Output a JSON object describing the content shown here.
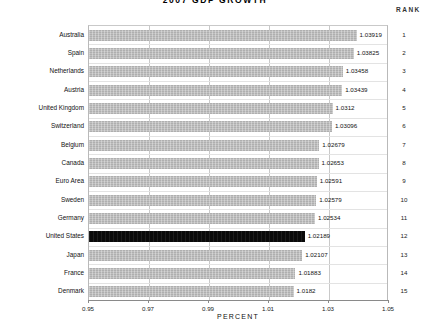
{
  "chart_data": {
    "type": "bar",
    "orientation": "horizontal",
    "title": "2007  GDP  GROWTH",
    "xlabel": "PERCENT",
    "ylabel": "",
    "xlim": [
      0.95,
      1.05
    ],
    "xticks": [
      "0.95",
      "0.97",
      "0.99",
      "1.01",
      "1.03",
      "1.05"
    ],
    "xtick_values": [
      0.95,
      0.97,
      0.99,
      1.01,
      1.03,
      1.05
    ],
    "grid": true,
    "legend": null,
    "rank_header": "RANK",
    "highlight_category": "United States",
    "highlight_color": "#0a0a0a",
    "bar_color": "#b8b8b8",
    "categories": [
      "Australia",
      "Spain",
      "Netherlands",
      "Austria",
      "United Kingdom",
      "Switzerland",
      "Belgium",
      "Canada",
      "Euro Area",
      "Sweden",
      "Germany",
      "United States",
      "Japan",
      "France",
      "Denmark"
    ],
    "values": [
      1.03919,
      1.03825,
      1.03458,
      1.03439,
      1.0312,
      1.03096,
      1.02679,
      1.02653,
      1.02591,
      1.02579,
      1.02534,
      1.02189,
      1.02107,
      1.01883,
      1.0182
    ],
    "value_labels": [
      "1.03919",
      "1.03825",
      "1.03458",
      "1.03439",
      "1.0312",
      "1.03096",
      "1.02679",
      "1.02653",
      "1.02591",
      "1.02579",
      "1.02534",
      "1.02189",
      "1.02107",
      "1.01883",
      "1.0182"
    ],
    "ranks": [
      "1",
      "2",
      "3",
      "4",
      "5",
      "6",
      "7",
      "8",
      "9",
      "10",
      "11",
      "12",
      "13",
      "14",
      "15"
    ]
  }
}
